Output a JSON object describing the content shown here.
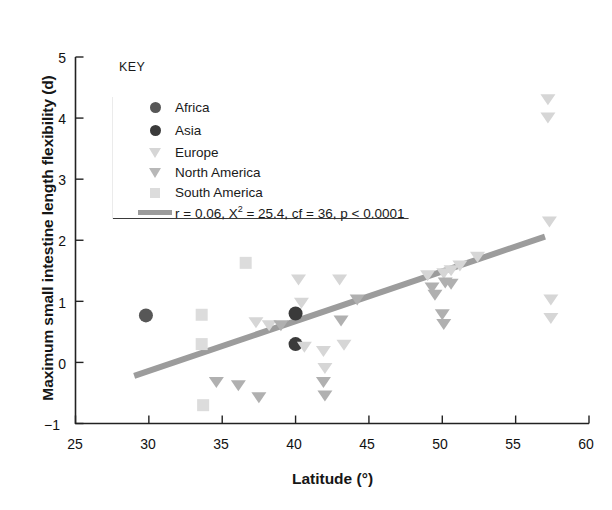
{
  "chart_data": {
    "type": "scatter",
    "title": "",
    "xlabel": "Latitude (°)",
    "ylabel": "Maximum small intestine length flexibility (d)",
    "xlim": [
      25,
      60
    ],
    "ylim": [
      -1,
      5
    ],
    "xticks": [
      25,
      30,
      35,
      40,
      45,
      50,
      55,
      60
    ],
    "yticks": [
      -1,
      0,
      1,
      2,
      3,
      4,
      5
    ],
    "grid": false,
    "legend_position": "top-left",
    "legend_title": "KEY",
    "annotation": "r = 0.06, X² = 25.4, cf = 36, p < 0.0001",
    "series": [
      {
        "name": "Africa",
        "marker": "circle",
        "color": "#575757",
        "points": [
          [
            29.8,
            0.77
          ]
        ]
      },
      {
        "name": "Asia",
        "marker": "circle",
        "color": "#3a3a3a",
        "points": [
          [
            40.0,
            0.8
          ],
          [
            40.0,
            0.3
          ]
        ]
      },
      {
        "name": "Europe",
        "marker": "triangle-down",
        "color": "#d6d6d6",
        "points": [
          [
            37.3,
            0.65
          ],
          [
            38.2,
            0.6
          ],
          [
            40.2,
            1.35
          ],
          [
            40.4,
            0.97
          ],
          [
            40.6,
            0.25
          ],
          [
            41.9,
            0.18
          ],
          [
            42.0,
            -0.1
          ],
          [
            43.0,
            1.35
          ],
          [
            43.3,
            0.28
          ],
          [
            49.0,
            1.42
          ],
          [
            50.1,
            1.45
          ],
          [
            50.6,
            1.5
          ],
          [
            51.2,
            1.58
          ],
          [
            52.4,
            1.72
          ],
          [
            57.2,
            4.3
          ],
          [
            57.2,
            4.0
          ],
          [
            57.3,
            2.3
          ],
          [
            57.4,
            1.02
          ],
          [
            57.4,
            0.72
          ]
        ]
      },
      {
        "name": "North America",
        "marker": "triangle-down",
        "color": "#b0b0b0",
        "points": [
          [
            34.6,
            -0.33
          ],
          [
            36.1,
            -0.38
          ],
          [
            37.5,
            -0.58
          ],
          [
            39.0,
            0.6
          ],
          [
            41.9,
            -0.33
          ],
          [
            42.0,
            -0.55
          ],
          [
            43.1,
            0.68
          ],
          [
            44.2,
            1.02
          ],
          [
            49.3,
            1.22
          ],
          [
            49.5,
            1.1
          ],
          [
            50.0,
            0.78
          ],
          [
            50.1,
            0.62
          ],
          [
            50.2,
            1.3
          ],
          [
            50.6,
            1.28
          ]
        ]
      },
      {
        "name": "South America",
        "marker": "square",
        "color": "#dcdcdc",
        "points": [
          [
            33.6,
            0.78
          ],
          [
            33.6,
            0.3
          ],
          [
            33.7,
            -0.7
          ],
          [
            36.6,
            1.63
          ]
        ]
      }
    ],
    "trendline": {
      "color": "#9c9c9c",
      "width": 6,
      "x_start": 29.0,
      "y_start": -0.22,
      "x_end": 57.0,
      "y_end": 2.06
    }
  },
  "axes": {
    "y_tick_labels": [
      "5",
      "4",
      "3",
      "2",
      "1",
      "0",
      "−1"
    ],
    "x_tick_labels": [
      "25",
      "30",
      "35",
      "40",
      "45",
      "50",
      "55",
      "60"
    ]
  },
  "legend": {
    "title": "KEY",
    "entries": [
      {
        "label": "Africa",
        "marker": "circle",
        "color": "#575757"
      },
      {
        "label": "Asia",
        "marker": "circle",
        "color": "#3a3a3a"
      },
      {
        "label": "Europe",
        "marker": "triangle-down",
        "color": "#d6d6d6"
      },
      {
        "label": "North America",
        "marker": "triangle-down",
        "color": "#b0b0b0"
      },
      {
        "label": "South America",
        "marker": "square",
        "color": "#dcdcdc"
      }
    ],
    "stats_line": {
      "marker": "line",
      "color": "#9c9c9c"
    }
  }
}
